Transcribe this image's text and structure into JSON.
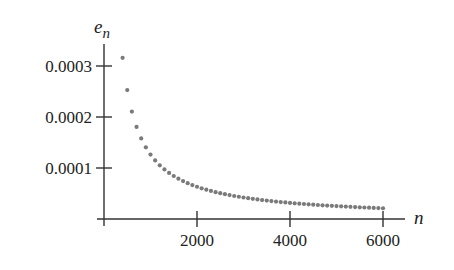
{
  "chart_data": {
    "type": "scatter",
    "title": "",
    "xlabel": "n",
    "ylabel": "e_n",
    "ylabel_main": "e",
    "ylabel_sub": "n",
    "xlim": [
      0,
      6500
    ],
    "ylim": [
      0,
      0.00034
    ],
    "grid": false,
    "legend": null,
    "x_ticks": [
      2000,
      4000,
      6000
    ],
    "x_tick_labels": [
      "2000",
      "4000",
      "6000"
    ],
    "y_ticks": [
      0.0001,
      0.0002,
      0.0003
    ],
    "y_tick_labels": [
      "0.0001",
      "0.0002",
      "0.0003"
    ],
    "series": [
      {
        "name": "e_n",
        "color": "#7a7a7a",
        "x_start": 400,
        "x_end": 6000,
        "x_step": 100,
        "formula_estimate": "e_n ≈ 0.1264 / n",
        "points_sample": [
          {
            "n": 400,
            "e": 0.000316
          },
          {
            "n": 500,
            "e": 0.000253
          },
          {
            "n": 600,
            "e": 0.000211
          },
          {
            "n": 1000,
            "e": 0.000126
          },
          {
            "n": 2000,
            "e": 6.32e-05
          },
          {
            "n": 3000,
            "e": 4.21e-05
          },
          {
            "n": 4000,
            "e": 3.16e-05
          },
          {
            "n": 5000,
            "e": 2.53e-05
          },
          {
            "n": 6000,
            "e": 2.11e-05
          }
        ]
      }
    ]
  }
}
